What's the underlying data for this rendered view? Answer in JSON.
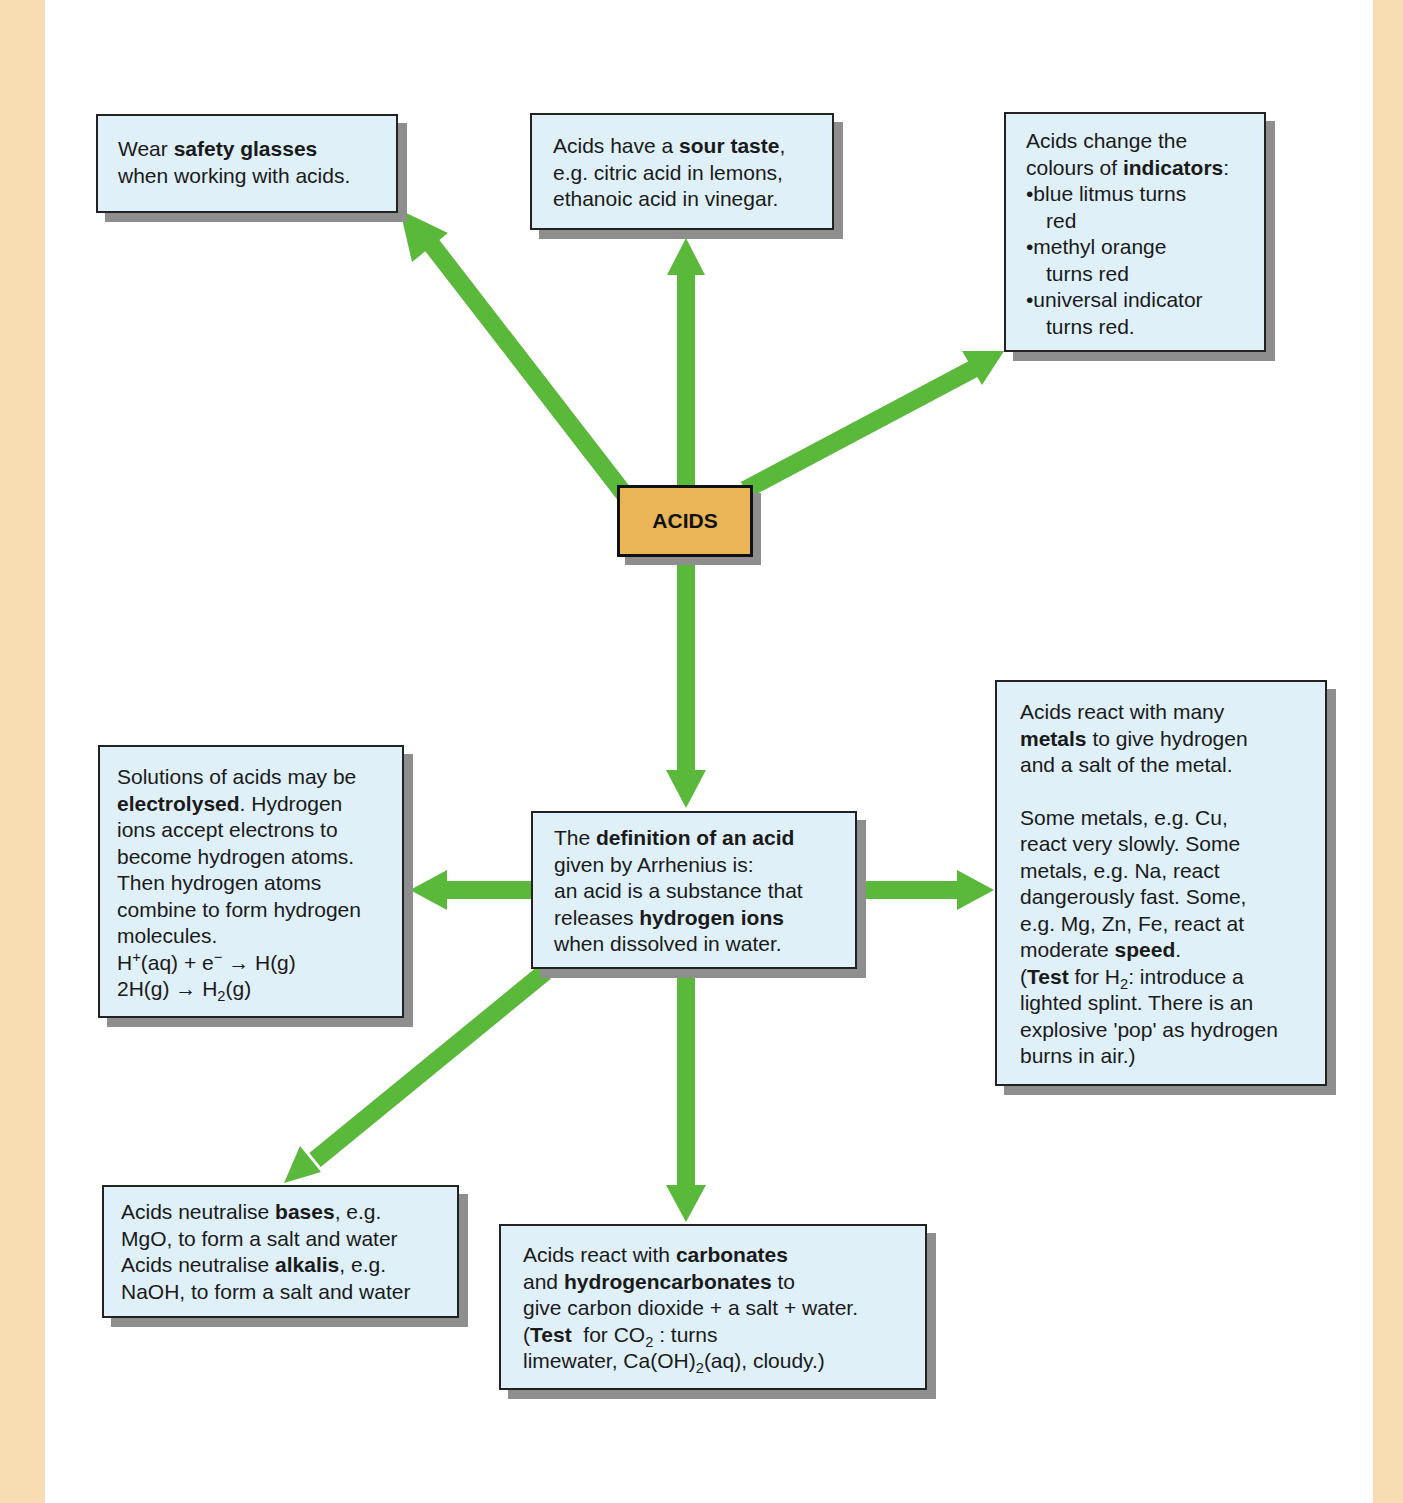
{
  "diagram": {
    "colors": {
      "margin": "#f8dcb2",
      "box_fill": "#dff0f8",
      "center_fill": "#e9b556",
      "arrow": "#5ab83a",
      "shadow": "#8e8e8e"
    },
    "center": {
      "label": "ACIDS"
    },
    "safety": {
      "l1a": "Wear ",
      "l1b": "safety glasses",
      "l2": "when working with acids."
    },
    "taste": {
      "l1a": "Acids have a ",
      "l1b": "sour taste",
      "l1c": ",",
      "l2": "e.g. citric acid in lemons,",
      "l3": "ethanoic acid in vinegar."
    },
    "indicators": {
      "l1": "Acids change the",
      "l2a": "colours of ",
      "l2b": "indicators",
      "l2c": ":",
      "bullet": "•",
      "b1a": "blue litmus turns",
      "b1b": "red",
      "b2a": "methyl orange",
      "b2b": "turns red",
      "b3a": "universal indicator",
      "b3b": "turns red."
    },
    "electrolysis": {
      "l1": "Solutions of acids may be",
      "l2a": "electrolysed",
      "l2b": ". Hydrogen",
      "l3": "ions accept electrons to",
      "l4": "become hydrogen atoms.",
      "l5": "Then hydrogen atoms",
      "l6": "combine to form hydrogen",
      "l7": "molecules.",
      "eq1a": "H",
      "eq1sup": "+",
      "eq1b": "(aq) + e",
      "eq1sup2": "−",
      "eq1c": " → H(g)",
      "eq2a": "2H(g) → H",
      "eq2sub": "2",
      "eq2b": "(g)"
    },
    "definition": {
      "l1a": "The ",
      "l1b": "definition of an acid",
      "l2": "given by Arrhenius is:",
      "l3": "an acid is a substance that",
      "l4a": "releases ",
      "l4b": "hydrogen ions",
      "l5": "when dissolved in water."
    },
    "metals": {
      "l1": "Acids react with many",
      "l2a": "metals",
      "l2b": " to give hydrogen",
      "l3": "and a salt of the metal.",
      "l4": "Some metals, e.g. Cu,",
      "l5": "react very slowly. Some",
      "l6": "metals, e.g. Na, react",
      "l7": "dangerously fast. Some,",
      "l8": "e.g. Mg, Zn, Fe, react at",
      "l9a": "moderate ",
      "l9b": "speed",
      "l9c": ".",
      "l10a": "(",
      "l10b": "Test",
      "l10c": " for H",
      "l10sub": "2",
      "l10d": ": introduce a",
      "l11": "lighted splint. There is an",
      "l12": "explosive 'pop' as hydrogen",
      "l13": "burns in air.)"
    },
    "bases": {
      "l1a": "Acids neutralise ",
      "l1b": "bases",
      "l1c": ", e.g.",
      "l2": "MgO, to form a salt and water",
      "l3a": "Acids neutralise ",
      "l3b": "alkalis",
      "l3c": ", e.g.",
      "l4": "NaOH, to form a salt and water"
    },
    "carbonates": {
      "l1a": "Acids react with ",
      "l1b": "carbonates",
      "l2a": "and ",
      "l2b": "hydrogencarbonates",
      "l2c": " to",
      "l3": "give carbon dioxide + a salt + water.",
      "l4a": "(",
      "l4b": "Test",
      "l4c": "  for CO",
      "l4sub": "2",
      "l4d": " : turns",
      "l5a": "limewater, Ca(OH)",
      "l5sub": "2",
      "l5b": "(aq), cloudy.)"
    }
  }
}
